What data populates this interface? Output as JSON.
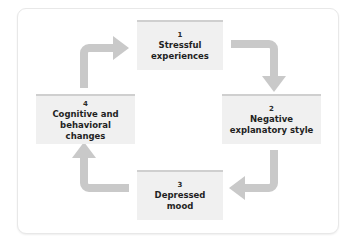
{
  "diagram": {
    "type": "cycle-flow-diagram",
    "title": "",
    "orientation": "clockwise",
    "colors": {
      "frame_background": "#ffffff",
      "frame_border": "#e8e8e8",
      "node_fill": "#f0f0f0",
      "node_top_accent": "#cfcfcf",
      "node_text": "#1f1f1f",
      "arrow_fill": "#c9c9c9"
    },
    "nodes": [
      {
        "id": "node-1",
        "number": "1",
        "label": "Stressful\nexperiences"
      },
      {
        "id": "node-2",
        "number": "2",
        "label": "Negative\nexplanatory style"
      },
      {
        "id": "node-3",
        "number": "3",
        "label": "Depressed\nmood"
      },
      {
        "id": "node-4",
        "number": "4",
        "label": "Cognitive and\nbehavioral changes"
      }
    ],
    "arrows": [
      {
        "id": "arrow-1-to-2",
        "from": "1",
        "to": "2",
        "shape": "elbow-right-then-down",
        "position": "top-right"
      },
      {
        "id": "arrow-2-to-3",
        "from": "2",
        "to": "3",
        "shape": "elbow-down-then-left",
        "position": "bottom-right"
      },
      {
        "id": "arrow-3-to-4",
        "from": "3",
        "to": "4",
        "shape": "elbow-left-then-up",
        "position": "bottom-left"
      },
      {
        "id": "arrow-4-to-1",
        "from": "4",
        "to": "1",
        "shape": "elbow-up-then-right",
        "position": "top-left"
      }
    ]
  }
}
